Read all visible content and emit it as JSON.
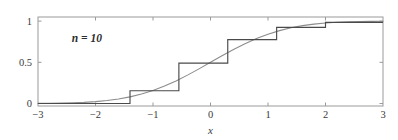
{
  "figure": {
    "annotation": "n = 10",
    "background_color": "#ffffff"
  },
  "chart_data": {
    "type": "line",
    "title": "",
    "subtitle": "",
    "xlabel": "x",
    "ylabel": "",
    "xlim": [
      -3,
      3
    ],
    "ylim": [
      -0.03,
      1.05
    ],
    "grid": false,
    "legend_position": "none",
    "annotations": [
      {
        "text": "n = 10",
        "x": -2.15,
        "y": 0.78
      }
    ],
    "xticks": [
      -3,
      -2,
      -1,
      0,
      1,
      2,
      3
    ],
    "xticklabels": [
      "−3",
      "−2",
      "−1",
      "0",
      "1",
      "2",
      "3"
    ],
    "yticks": [
      0,
      0.5,
      1
    ],
    "yticklabels": [
      "0",
      "0.5",
      "1"
    ],
    "series": [
      {
        "name": "normal-cdf",
        "type": "line",
        "color": "#8c8c8c",
        "style": "smooth",
        "x": [
          -3.0,
          -2.8,
          -2.6,
          -2.4,
          -2.2,
          -2.0,
          -1.8,
          -1.6,
          -1.4,
          -1.2,
          -1.0,
          -0.8,
          -0.6,
          -0.4,
          -0.2,
          0.0,
          0.2,
          0.4,
          0.6,
          0.8,
          1.0,
          1.2,
          1.4,
          1.6,
          1.8,
          2.0,
          2.2,
          2.4,
          2.6,
          2.8,
          3.0
        ],
        "y": [
          0.0013,
          0.0026,
          0.0047,
          0.0082,
          0.0139,
          0.0228,
          0.0359,
          0.0548,
          0.0808,
          0.1151,
          0.1587,
          0.2119,
          0.2743,
          0.3446,
          0.4207,
          0.5,
          0.5793,
          0.6554,
          0.7257,
          0.7881,
          0.8413,
          0.8849,
          0.9192,
          0.9452,
          0.9641,
          0.9772,
          0.9861,
          0.9918,
          0.9953,
          0.9974,
          0.9987
        ]
      },
      {
        "name": "empirical-cdf-step",
        "type": "step",
        "color": "#4a4a4a",
        "style": "post",
        "jump_x": [
          -1.4,
          -0.55,
          0.3,
          1.15,
          2.0
        ],
        "levels": [
          0.0,
          0.155,
          0.49,
          0.775,
          0.925,
          0.985
        ],
        "x": [
          -3.0,
          -1.4,
          -1.4,
          -0.55,
          -0.55,
          0.3,
          0.3,
          1.15,
          1.15,
          2.0,
          2.0,
          3.0
        ],
        "y": [
          0.0,
          0.0,
          0.155,
          0.155,
          0.49,
          0.49,
          0.775,
          0.775,
          0.925,
          0.925,
          0.985,
          0.985
        ]
      }
    ]
  },
  "axes_geometry": {
    "left_px": 38,
    "right_px": 383,
    "top_px": 17,
    "bottom_px": 106
  }
}
